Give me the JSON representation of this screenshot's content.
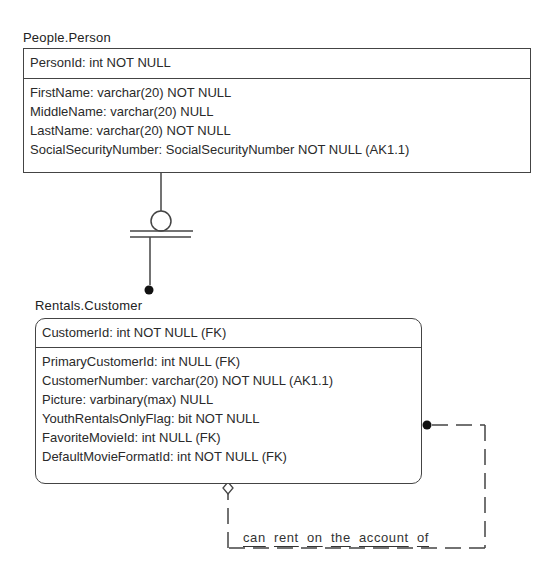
{
  "entities": {
    "person": {
      "title": "People.Person",
      "primary_key": [
        "PersonId: int NOT NULL"
      ],
      "attributes": [
        "FirstName: varchar(20) NOT NULL",
        "MiddleName: varchar(20) NULL",
        "LastName: varchar(20) NOT NULL",
        "SocialSecurityNumber: SocialSecurityNumber NOT NULL (AK1.1)"
      ]
    },
    "customer": {
      "title": "Rentals.Customer",
      "primary_key": [
        "CustomerId: int NOT NULL (FK)"
      ],
      "attributes": [
        "PrimaryCustomerId: int NULL (FK)",
        "CustomerNumber: varchar(20) NOT NULL (AK1.1)",
        "Picture: varbinary(max) NULL",
        "YouthRentalsOnlyFlag: bit NOT NULL",
        "FavoriteMovieId: int NULL (FK)",
        "DefaultMovieFormatId: int NOT NULL (FK)"
      ]
    }
  },
  "relationships": {
    "person_customer": {
      "type": "identifying-subtype",
      "from": "People.Person",
      "to": "Rentals.Customer",
      "parent_notation": "zero-or-one-circle-with-double-bar",
      "child_notation": "filled-dot"
    },
    "customer_self": {
      "type": "non-identifying-optional",
      "from": "Rentals.Customer",
      "to": "Rentals.Customer",
      "label_words": [
        "can",
        "rent",
        "on",
        "the",
        "account",
        "of"
      ],
      "parent_notation": "hollow-diamond",
      "child_notation": "filled-dot",
      "line_style": "dashed"
    }
  },
  "colors": {
    "line": "#444444",
    "text": "#2a2a2a",
    "background": "#ffffff"
  }
}
